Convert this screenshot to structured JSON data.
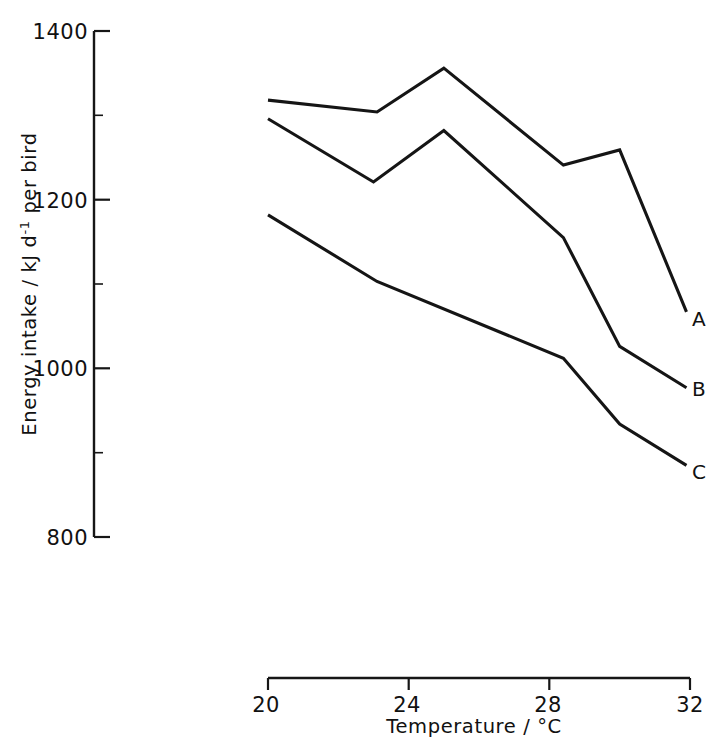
{
  "chart_data": {
    "type": "line",
    "title": "",
    "xlabel": "Temperature / °C",
    "ylabel": "Energy intake / kJ d⁻¹ per bird",
    "ylabel_parts": {
      "before": "Energy intake / kJ d",
      "superscript": "-1",
      "after": " per bird"
    },
    "xlim": [
      20,
      32
    ],
    "ylim": [
      800,
      1400
    ],
    "xticks": [
      20,
      24,
      28,
      32
    ],
    "xtick_labels": [
      "20",
      "24",
      "28",
      "32"
    ],
    "yticks": [
      800,
      1000,
      1200,
      1400
    ],
    "ytick_labels": [
      "800",
      "1000",
      "1200",
      "1400"
    ],
    "yticks_minor": [
      900,
      1100,
      1300
    ],
    "grid": false,
    "legend_position": "line-end-labels",
    "series": [
      {
        "name": "A",
        "label": "A",
        "x": [
          20.0,
          23.1,
          25.0,
          28.4,
          30.0,
          31.9
        ],
        "values": [
          1318,
          1304,
          1356,
          1241,
          1259,
          1067
        ]
      },
      {
        "name": "B",
        "label": "B",
        "x": [
          20.0,
          23.0,
          25.0,
          28.4,
          30.0,
          31.9
        ],
        "values": [
          1296,
          1221,
          1282,
          1155,
          1026,
          977
        ]
      },
      {
        "name": "C",
        "label": "C",
        "x": [
          20.0,
          23.1,
          28.4,
          30.0,
          31.9
        ],
        "values": [
          1182,
          1103,
          1012,
          934,
          885
        ]
      }
    ]
  },
  "axes_geometry": {
    "x_left_px": 268,
    "x_right_px": 690,
    "y_top_px": 31,
    "y_bottom_px": 537,
    "x_axis_y_px": 678,
    "y_axis_x_px": 94
  }
}
